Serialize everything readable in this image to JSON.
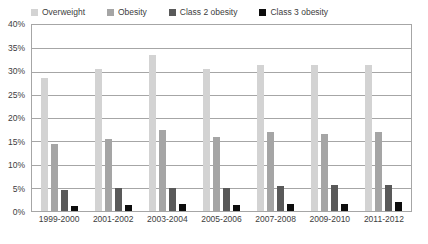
{
  "chart_data": {
    "type": "bar",
    "title": "",
    "xlabel": "",
    "ylabel": "",
    "ylim": [
      0,
      40
    ],
    "y_unit": "%",
    "grid": true,
    "legend_position": "top",
    "categories": [
      "1999-2000",
      "2001-2002",
      "2003-2004",
      "2005-2006",
      "2007-2008",
      "2009-2010",
      "2011-2012"
    ],
    "y_ticks": [
      "0%",
      "5%",
      "10%",
      "15%",
      "20%",
      "25%",
      "30%",
      "35%",
      "40%"
    ],
    "y_tick_values": [
      0,
      5,
      10,
      15,
      20,
      25,
      30,
      35,
      40
    ],
    "series": [
      {
        "name": "Overweight",
        "color": "#d3d3d3",
        "values": [
          28.5,
          30.5,
          33.5,
          30.5,
          31.5,
          31.5,
          31.5
        ]
      },
      {
        "name": "Obesity",
        "color": "#a5a5a5",
        "values": [
          14.5,
          15.5,
          17.5,
          16.0,
          17.0,
          16.5,
          17.0
        ]
      },
      {
        "name": "Class 2 obesity",
        "color": "#595959",
        "values": [
          4.5,
          5.0,
          5.0,
          5.0,
          5.3,
          5.7,
          5.7
        ]
      },
      {
        "name": "Class 3 obesity",
        "color": "#0d0d0d",
        "values": [
          1.0,
          1.2,
          1.5,
          1.3,
          1.5,
          1.5,
          2.0
        ]
      }
    ]
  }
}
